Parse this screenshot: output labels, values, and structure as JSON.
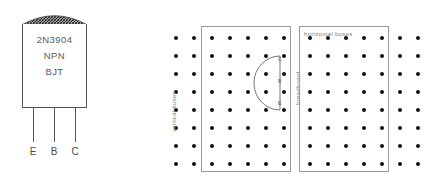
{
  "transistor": {
    "part_number": "2N3904",
    "type_label": "NPN",
    "device_label": "BJT",
    "pins": [
      {
        "id": "e",
        "label": "E",
        "name": "emitter"
      },
      {
        "id": "b",
        "label": "B",
        "name": "base"
      },
      {
        "id": "c",
        "label": "C",
        "name": "collector"
      }
    ],
    "body_color": "#555555",
    "text_color": "#5a5a5a"
  },
  "breadboard": {
    "left_board": {
      "label_vertical_buses": "vertical buses",
      "label_breadboard": "breadboard",
      "grid": {
        "rows": 8,
        "cols": 7,
        "spacing_px": 18,
        "dot_color": "#111111"
      },
      "bus_rect": {
        "from_col": 3,
        "to_col": 7,
        "border_color": "#9a9a9a"
      },
      "pin_callouts": [
        {
          "id": "c",
          "label": "C"
        },
        {
          "id": "b",
          "label": "B"
        },
        {
          "id": "e",
          "label": "E"
        }
      ]
    },
    "right_board": {
      "label_horizontal_buses": "horizontal buses",
      "grid": {
        "rows": 8,
        "cols": 7,
        "spacing_px": 18,
        "dot_color": "#111111"
      },
      "bus_rect": {
        "from_col": 1,
        "to_col": 5,
        "border_color": "#9a9a9a"
      }
    }
  },
  "colors": {
    "background": "#ffffff",
    "ink": "#111111",
    "outline": "#555555",
    "muted_text": "#7a7a7a"
  }
}
